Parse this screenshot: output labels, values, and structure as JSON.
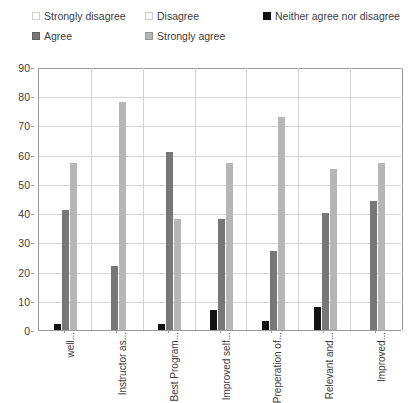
{
  "chart_data": {
    "type": "bar",
    "title": "",
    "xlabel": "",
    "ylabel": "",
    "ylim": [
      0,
      90
    ],
    "ytick_step": 10,
    "yticks": [
      "90",
      "80",
      "70",
      "60",
      "50",
      "40",
      "30",
      "20",
      "10",
      "0"
    ],
    "grid": true,
    "legend_position": "top",
    "categories": [
      "well...",
      "Instructor as...",
      "Best Program...",
      "Improved self...",
      "Preperation of...",
      "Relevant and...",
      "Improved..."
    ],
    "series": [
      {
        "name": "Strongly disagree",
        "color": "#ffffff",
        "values": [
          0,
          0,
          0,
          0,
          0,
          0,
          0
        ]
      },
      {
        "name": "Disagree",
        "color": "#fafafa",
        "values": [
          0,
          0,
          0,
          0,
          0,
          0,
          0
        ]
      },
      {
        "name": "Neither agree nor disagree",
        "color": "#131313",
        "values": [
          2,
          0,
          2,
          7,
          3,
          8,
          0
        ]
      },
      {
        "name": "Agree",
        "color": "#777777",
        "values": [
          41,
          22,
          61,
          38,
          27,
          40,
          44
        ]
      },
      {
        "name": "Strongly agree",
        "color": "#b6b6b6",
        "values": [
          57,
          78,
          38,
          57,
          73,
          55,
          57
        ]
      }
    ]
  },
  "legend": {
    "row1": [
      {
        "label": "Strongly disagree",
        "color": "#ffffff"
      },
      {
        "label": "Disagree",
        "color": "#fafafa"
      },
      {
        "label": "Neither agree nor disagree",
        "color": "#131313"
      }
    ],
    "row2": [
      {
        "label": "Agree",
        "color": "#777777"
      },
      {
        "label": "Strongly agree",
        "color": "#b6b6b6"
      }
    ]
  }
}
